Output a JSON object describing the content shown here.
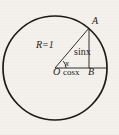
{
  "figure": {
    "kind": "unit-circle-trigonometry-diagram",
    "background_color": "#f4f1ec",
    "ink_color": "#1a1a1a",
    "canvas": {
      "width": 119,
      "height": 135
    },
    "circle": {
      "center_x": 55,
      "center_y": 68,
      "radius": 52,
      "stroke_width": 1.6
    },
    "points": {
      "O": {
        "x": 55,
        "y": 68,
        "label": "O",
        "description": "circle center and angle vertex"
      },
      "A": {
        "x": 89,
        "y": 28,
        "label": "A",
        "description": "point on circle at angle x"
      },
      "B": {
        "x": 89,
        "y": 68,
        "label": "B",
        "description": "foot of perpendicular from A to horizontal radius"
      }
    },
    "segments": [
      {
        "name": "radius-OA",
        "from": "O",
        "to": "A",
        "label": "R=1"
      },
      {
        "name": "vertical-AB",
        "from": "A",
        "to": "B",
        "label": "sinx"
      },
      {
        "name": "horizontal-OB",
        "from": "O",
        "to": "B",
        "label": "cosx"
      }
    ],
    "angle": {
      "vertex": "O",
      "label": "x",
      "arc_radius": 11
    },
    "labels": {
      "point_a": "A",
      "radius": "R=1",
      "sine": "sinx",
      "angle": "x",
      "origin": "O",
      "cosine": "cosx",
      "point_b": "B"
    }
  }
}
